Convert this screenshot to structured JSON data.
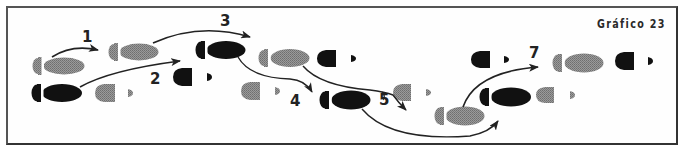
{
  "figure": {
    "title": "Gráfico 23",
    "colors": {
      "gray_foot": "#8a8a8a",
      "black_foot": "#111111",
      "arrow": "#222222",
      "frame": "#555555"
    },
    "legend_note": "Gray footprints = one foot, black footprints = other foot; full print = heel + sole, partial print = toe only (heel raised)",
    "steps": [
      {
        "label": "1"
      },
      {
        "label": "2"
      },
      {
        "label": "3"
      },
      {
        "label": "4"
      },
      {
        "label": "5"
      },
      {
        "label": "7"
      }
    ],
    "footprints": [
      {
        "id": "f1",
        "color": "gray",
        "type": "full",
        "x": 33,
        "y": 66
      },
      {
        "id": "f2",
        "color": "black",
        "type": "full",
        "x": 32,
        "y": 93
      },
      {
        "id": "f3",
        "color": "gray",
        "type": "partial",
        "x": 95,
        "y": 93
      },
      {
        "id": "f4",
        "color": "gray",
        "type": "full",
        "x": 109,
        "y": 52
      },
      {
        "id": "f5",
        "color": "black",
        "type": "partial",
        "x": 173,
        "y": 77
      },
      {
        "id": "f6",
        "color": "black",
        "type": "full",
        "x": 196,
        "y": 50
      },
      {
        "id": "f7",
        "color": "gray",
        "type": "partial",
        "x": 241,
        "y": 91
      },
      {
        "id": "f8",
        "color": "gray",
        "type": "full",
        "x": 259,
        "y": 58
      },
      {
        "id": "f9",
        "color": "black",
        "type": "partial",
        "x": 317,
        "y": 58
      },
      {
        "id": "f10",
        "color": "black",
        "type": "full",
        "x": 320,
        "y": 100
      },
      {
        "id": "f11",
        "color": "gray",
        "type": "partial",
        "x": 393,
        "y": 92
      },
      {
        "id": "f12",
        "color": "gray",
        "type": "full",
        "x": 435,
        "y": 116
      },
      {
        "id": "f13",
        "color": "black",
        "type": "partial",
        "x": 471,
        "y": 59
      },
      {
        "id": "f14",
        "color": "black",
        "type": "full",
        "x": 480,
        "y": 97
      },
      {
        "id": "f15",
        "color": "gray",
        "type": "partial",
        "x": 536,
        "y": 95
      },
      {
        "id": "f16",
        "color": "gray",
        "type": "full",
        "x": 553,
        "y": 63
      },
      {
        "id": "f17",
        "color": "black",
        "type": "partial",
        "x": 615,
        "y": 61
      }
    ]
  }
}
